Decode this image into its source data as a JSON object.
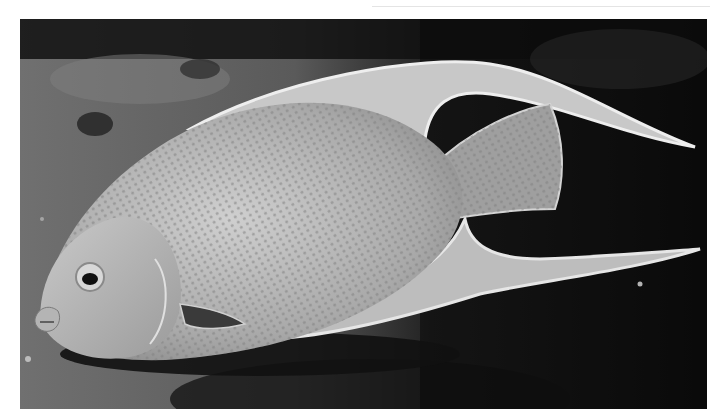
{
  "image": {
    "subject": "angelfish",
    "description": "Grayscale photograph of an angelfish swimming left over a dark reef background",
    "palette": {
      "background_dark": "#0d0d0d",
      "sand": "#6e6e6e",
      "body": "#b8b8b8",
      "fin_edge": "#e6e6e6",
      "shadow": "#1a1a1a"
    }
  }
}
